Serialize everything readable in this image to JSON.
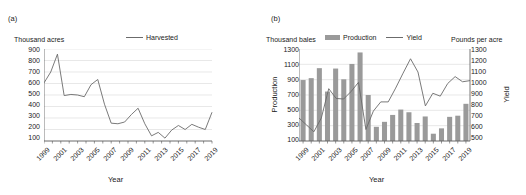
{
  "figure": {
    "panel_a_tag": "(a)",
    "panel_b_tag": "(b)"
  },
  "panel_a": {
    "unit_label": "Thousand acres",
    "legend": [
      {
        "name": "harvested",
        "label": "Harvested",
        "type": "line",
        "color": "#6b6b6b"
      }
    ],
    "xlabel": "Year",
    "chart_data": {
      "type": "line",
      "title": "",
      "xlabel": "Year",
      "ylabel": "Thousand acres",
      "ylim": [
        100,
        900
      ],
      "ytick_step": 100,
      "yticks": [
        100,
        200,
        300,
        400,
        500,
        600,
        700,
        800,
        900
      ],
      "grid": true,
      "legend_position": "top-center",
      "x": [
        1999,
        2000,
        2001,
        2002,
        2003,
        2004,
        2005,
        2006,
        2007,
        2008,
        2009,
        2010,
        2011,
        2012,
        2013,
        2014,
        2015,
        2016,
        2017,
        2018,
        2019
      ],
      "xtick_labels": [
        "1999",
        "2001",
        "2003",
        "2005",
        "2007",
        "2009",
        "2011",
        "2013",
        "2015",
        "2017",
        "2019"
      ],
      "series": [
        {
          "name": "Harvested",
          "color": "#6b6b6b",
          "values": [
            605,
            700,
            855,
            495,
            505,
            500,
            485,
            590,
            635,
            420,
            255,
            250,
            265,
            330,
            385,
            250,
            145,
            175,
            125,
            195,
            235,
            200,
            245,
            220,
            200,
            350
          ]
        }
      ]
    }
  },
  "panel_b": {
    "unit_label_left": "Thousand bales",
    "unit_label_right": "Pounds per acre",
    "ylabel_left": "Production",
    "ylabel_right": "Yield",
    "xlabel": "Year",
    "legend": [
      {
        "name": "production",
        "label": "Production",
        "type": "bar",
        "color": "#9a9a9a"
      },
      {
        "name": "yield",
        "label": "Yield",
        "type": "line",
        "color": "#6b6b6b"
      }
    ],
    "chart_data": {
      "type": "bar",
      "title": "",
      "xlabel": "Year",
      "ylabel": "Production",
      "ylabel_secondary": "Yield",
      "ylim": [
        100,
        1300
      ],
      "ytick_step": 200,
      "yticks": [
        100,
        300,
        500,
        700,
        900,
        1100,
        1300
      ],
      "ylim_secondary": [
        500,
        1300
      ],
      "ytick_step_secondary": 100,
      "yticks_secondary": [
        500,
        600,
        700,
        800,
        900,
        1000,
        1100,
        1200,
        1300
      ],
      "grid": true,
      "legend_position": "top-center",
      "categories": [
        1999,
        2000,
        2001,
        2002,
        2003,
        2004,
        2005,
        2006,
        2007,
        2008,
        2009,
        2010,
        2011,
        2012,
        2013,
        2014,
        2015,
        2016,
        2017,
        2018,
        2019
      ],
      "xtick_labels": [
        "1999",
        "2001",
        "2003",
        "2005",
        "2007",
        "2009",
        "2011",
        "2013",
        "2015",
        "2017",
        "2019"
      ],
      "series": [
        {
          "name": "Production",
          "type": "bar",
          "axis": "left",
          "color": "#9a9a9a",
          "values": [
            895,
            920,
            1050,
            745,
            1045,
            905,
            1105,
            1255,
            700,
            285,
            350,
            440,
            510,
            475,
            335,
            420,
            195,
            265,
            415,
            430,
            585
          ]
        },
        {
          "name": "Yield",
          "type": "line",
          "axis": "right",
          "color": "#6b6b6b",
          "values": [
            700,
            640,
            580,
            700,
            955,
            870,
            865,
            930,
            1010,
            600,
            760,
            840,
            840,
            960,
            1090,
            1215,
            1100,
            805,
            915,
            890,
            1000,
            1060,
            1015,
            1025
          ]
        }
      ]
    }
  }
}
